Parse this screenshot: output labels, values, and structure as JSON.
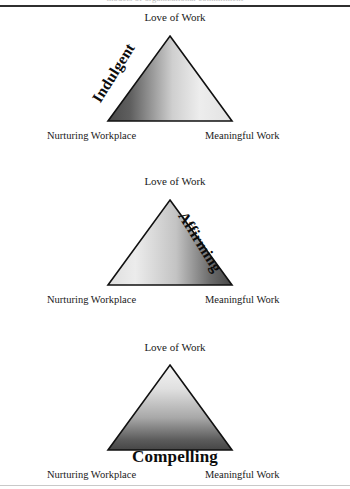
{
  "page": {
    "clipped_header_text": "models of organizational commitment",
    "background": "#ffffff",
    "rule_color": "#2f2f2f"
  },
  "common_labels": {
    "apex": "Love of Work",
    "bottom_left": "Nurturing Workplace",
    "bottom_right": "Meaningful Work"
  },
  "diagrams": [
    {
      "id": "indulgent",
      "edge_label": "Indulgent",
      "edge_label_position": "left-edge",
      "edge_label_rotation_deg": -58,
      "apex": "Love of Work",
      "bottom_left": "Nurturing Workplace",
      "bottom_right": "Meaningful Work",
      "gradient": {
        "type": "linear",
        "direction": "left-to-right",
        "from": "#4e4e4e",
        "to": "#ececec"
      },
      "outline_color": "#111111"
    },
    {
      "id": "affirming",
      "edge_label": "Affirming",
      "edge_label_position": "right-edge",
      "edge_label_rotation_deg": 58,
      "apex": "Love of Work",
      "bottom_left": "Nurturing Workplace",
      "bottom_right": "Meaningful Work",
      "gradient": {
        "type": "linear",
        "direction": "left-to-right",
        "from": "#ececec",
        "to": "#4a4a4a"
      },
      "outline_color": "#111111"
    },
    {
      "id": "compelling",
      "edge_label": "Compelling",
      "edge_label_position": "base",
      "edge_label_rotation_deg": 0,
      "apex": "Love of Work",
      "bottom_left": "Nurturing Workplace",
      "bottom_right": "Meaningful Work",
      "gradient": {
        "type": "linear",
        "direction": "top-to-bottom",
        "from": "#f2f2f2",
        "to": "#4a4a4a"
      },
      "outline_color": "#111111"
    }
  ]
}
